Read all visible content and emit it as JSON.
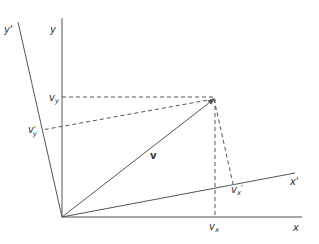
{
  "diagram": {
    "type": "coordinate-rotation",
    "colors": {
      "line": "#555555",
      "text": "#333333",
      "background": "#ffffff"
    },
    "axes": {
      "x": {
        "label": "x"
      },
      "y": {
        "label": "y"
      },
      "x_prime": {
        "label": "x'"
      },
      "y_prime": {
        "label": "y'"
      }
    },
    "vector": {
      "label": "v"
    },
    "components": {
      "vx": {
        "base": "v",
        "sub": "x"
      },
      "vy": {
        "base": "v",
        "sub": "y"
      },
      "vx_prime": {
        "base": "v",
        "sub": "x",
        "prime": "'"
      },
      "vy_prime": {
        "base": "v",
        "prime": "'",
        "sub": "y"
      }
    }
  }
}
